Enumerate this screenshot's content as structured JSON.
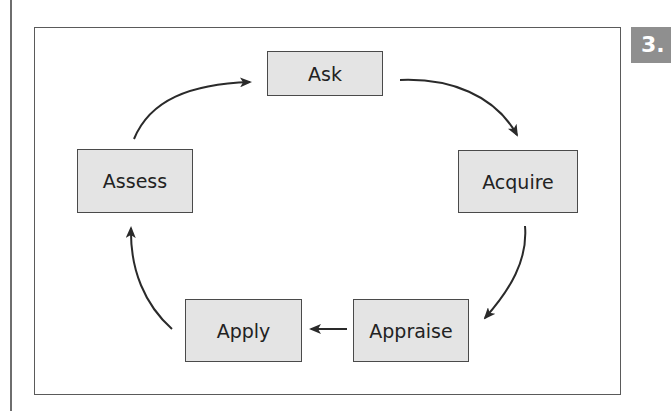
{
  "page": {
    "badge_text": "3."
  },
  "diagram": {
    "type": "cycle",
    "nodes": [
      {
        "id": "ask",
        "label": "Ask"
      },
      {
        "id": "acquire",
        "label": "Acquire"
      },
      {
        "id": "appraise",
        "label": "Appraise"
      },
      {
        "id": "apply",
        "label": "Apply"
      },
      {
        "id": "assess",
        "label": "Assess"
      }
    ],
    "edges": [
      {
        "from": "ask",
        "to": "acquire"
      },
      {
        "from": "acquire",
        "to": "appraise"
      },
      {
        "from": "appraise",
        "to": "apply"
      },
      {
        "from": "apply",
        "to": "assess"
      },
      {
        "from": "assess",
        "to": "ask"
      }
    ],
    "colors": {
      "node_fill": "#e4e4e4",
      "node_border": "#4a4a4a",
      "arrow": "#2a2a2a",
      "badge": "#8f8f8f"
    }
  }
}
